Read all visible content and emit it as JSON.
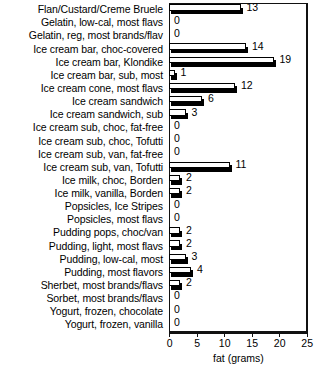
{
  "chart_data": {
    "type": "bar",
    "orientation": "horizontal",
    "title": "",
    "xlabel": "fat (grams)",
    "ylabel": "",
    "xlim": [
      0,
      25
    ],
    "xticks": [
      0,
      5,
      10,
      15,
      20,
      25
    ],
    "grid": false,
    "legend": null,
    "value_labels": true,
    "categories": [
      "Flan/Custard/Creme Bruele",
      "Gelatin, low-cal, most flavs",
      "Gelatin, reg, most brands/flav",
      "Ice cream bar, choc-covered",
      "Ice cream bar, Klondike",
      "Ice cream bar, sub, most",
      "Ice cream cone, most flavs",
      "Ice cream sandwich",
      "Ice cream sandwich, sub",
      "Ice cream sub, choc, fat-free",
      "Ice cream sub, choc, Tofutti",
      "Ice cream sub, van, fat-free",
      "Ice cream sub, van, Tofutti",
      "Ice milk, choc, Borden",
      "Ice milk, vanilla, Borden",
      "Popsicles, Ice Stripes",
      "Popsicles, most flavs",
      "Pudding pops, choc/van",
      "Pudding, light, most flavs",
      "Pudding, low-cal, most",
      "Pudding, most flavors",
      "Sherbet, most brands/flavs",
      "Sorbet, most brands/flavs",
      "Yogurt, frozen, chocolate",
      "Yogurt, frozen, vanilla"
    ],
    "values": [
      13,
      0,
      0,
      14,
      19,
      1,
      12,
      6,
      3,
      0,
      0,
      0,
      11,
      2,
      2,
      0,
      0,
      2,
      2,
      3,
      4,
      2,
      0,
      0,
      0
    ],
    "colors": {
      "bar_face": "#ffffff",
      "bar_outline": "#000000",
      "bar_shadow": "#000000",
      "axis": "#111111",
      "text": "#000000",
      "background": "#ffffff"
    }
  }
}
